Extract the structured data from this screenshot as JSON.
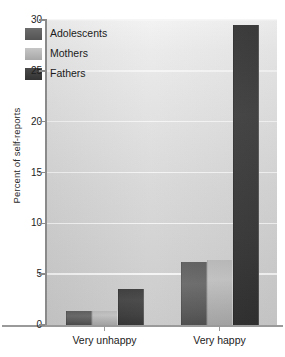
{
  "chart_data": {
    "type": "bar",
    "title": "",
    "xlabel": "",
    "ylabel": "Percent of self-reports",
    "categories": [
      "Very unhappy",
      "Very happy"
    ],
    "series": [
      {
        "name": "Adolescents",
        "values": [
          1.4,
          6.2
        ],
        "color": "#5e5e5e"
      },
      {
        "name": "Mothers",
        "values": [
          1.4,
          6.4
        ],
        "color": "#b9b9b9"
      },
      {
        "name": "Fathers",
        "values": [
          3.5,
          29.5
        ],
        "color": "#3a3a3a"
      }
    ],
    "ylim": [
      0,
      30
    ],
    "yticks": [
      "0",
      "5",
      "10",
      "15",
      "20",
      "25",
      "30"
    ],
    "ytick_values": [
      0,
      5,
      10,
      15,
      20,
      25,
      30
    ],
    "grid": true,
    "legend_position": "upper left inside plot",
    "plot_background": "#d9d9d9"
  },
  "legend": {
    "items": [
      {
        "label": "Adolescents"
      },
      {
        "label": "Mothers"
      },
      {
        "label": "Fathers"
      }
    ]
  }
}
